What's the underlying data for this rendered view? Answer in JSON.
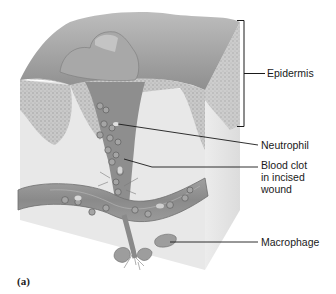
{
  "figure": {
    "panel_label": "(a)",
    "labels": [
      {
        "id": "epidermis",
        "text": "Epidermis"
      },
      {
        "id": "neutrophil",
        "text": "Neutrophil"
      },
      {
        "id": "blood_clot",
        "text": "Blood clot in incised wound",
        "lines": [
          "Blood clot",
          "in incised",
          "wound"
        ]
      },
      {
        "id": "macrophage",
        "text": "Macrophage"
      }
    ]
  },
  "colors": {
    "tissue_gray": "#b8b8b8",
    "surface_gray": "#9e9e9e",
    "dermis_light": "#e6e6e6",
    "vessel_gray": "#8a8a8a",
    "leader_line": "#1a1a1a"
  }
}
